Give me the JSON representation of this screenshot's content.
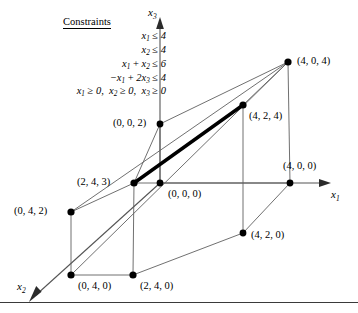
{
  "figure": {
    "type": "3d-polytope-diagram",
    "width": 358,
    "height": 313,
    "background": "#ffffff",
    "line_color": "#555555",
    "highlight_color": "#000000",
    "vertex_color": "#000000"
  },
  "constraints": {
    "title": "Constraints",
    "lines": [
      {
        "id": "c1",
        "text": "x1 ≤ 4",
        "html": "<i>x</i><sub>1</sub> <span class=\"op\">≤</span> 4"
      },
      {
        "id": "c2",
        "text": "x2 ≤ 4",
        "html": "<i>x</i><sub>2</sub> <span class=\"op\">≤</span> 4"
      },
      {
        "id": "c3",
        "text": "x1 + x2 ≤ 6",
        "html": "<i>x</i><sub>1</sub> <span class=\"op\">+</span> <i>x</i><sub>2</sub> <span class=\"op\">≤</span> 6"
      },
      {
        "id": "c4",
        "text": "−x1 + 2x3 ≤ 4",
        "html": "<span class=\"op\">−</span><i>x</i><sub>1</sub> <span class=\"op\">+</span> 2<i>x</i><sub>3</sub> <span class=\"op\">≤</span> 4"
      },
      {
        "id": "c5",
        "text": "x1 ≥ 0,  x2 ≥ 0,  x3 ≥ 0",
        "html": "<i>x</i><sub>1</sub> <span class=\"op\">≥</span> 0,&nbsp; <i>x</i><sub>2</sub> <span class=\"op\">≥</span> 0,&nbsp; <i>x</i><sub>3</sub> <span class=\"op\">≥</span> 0"
      }
    ]
  },
  "axes": [
    {
      "id": "x1",
      "label": "x1",
      "html": "<i>x</i><sub>1</sub>",
      "x": 330,
      "y": 190,
      "direction": "right"
    },
    {
      "id": "x2",
      "label": "x2",
      "html": "<i>x</i><sub>2</sub>",
      "x": 18,
      "y": 282,
      "direction": "down-left"
    },
    {
      "id": "x3",
      "label": "x3",
      "html": "<i>x</i><sub>3</sub>",
      "x": 150,
      "y": 8,
      "direction": "up"
    }
  ],
  "vertices": [
    {
      "id": "v000",
      "label": "(0, 0, 0)",
      "px": 160,
      "py": 183,
      "label_x": 168,
      "label_y": 189,
      "dot": true
    },
    {
      "id": "v002",
      "label": "(0, 0, 2)",
      "px": 160,
      "py": 124,
      "label_x": 113,
      "label_y": 118,
      "dot": true
    },
    {
      "id": "v400",
      "label": "(4, 0, 0)",
      "px": 290,
      "py": 183,
      "label_x": 283,
      "label_y": 161,
      "dot": true
    },
    {
      "id": "v404",
      "label": "(4, 0, 4)",
      "px": 288,
      "py": 62,
      "label_x": 297,
      "label_y": 56,
      "dot": true
    },
    {
      "id": "v424",
      "label": "(4, 2, 4)",
      "px": 243,
      "py": 105,
      "label_x": 249,
      "label_y": 111,
      "dot": true
    },
    {
      "id": "v420",
      "label": "(4, 2, 0)",
      "px": 243,
      "py": 233,
      "label_x": 251,
      "label_y": 239,
      "dot": true
    },
    {
      "id": "v243",
      "label": "(2, 4, 3)",
      "px": 134,
      "py": 183,
      "label_x": 77,
      "label_y": 177,
      "dot": true
    },
    {
      "id": "v240",
      "label": "(2, 4, 0)",
      "px": 133,
      "py": 275,
      "label_x": 140,
      "label_y": 281,
      "dot": true
    },
    {
      "id": "v042",
      "label": "(0, 4, 2)",
      "px": 71,
      "py": 212,
      "label_x": 14,
      "label_y": 206,
      "dot": true
    },
    {
      "id": "v040",
      "label": "(0, 4, 0)",
      "px": 71,
      "py": 275,
      "label_x": 78,
      "label_y": 281,
      "dot": true
    }
  ],
  "edges": [
    {
      "from": "v000",
      "to": "v400",
      "style": "thin"
    },
    {
      "from": "v000",
      "to": "v002",
      "style": "thin"
    },
    {
      "from": "v000",
      "to": "v243",
      "style": "thin"
    },
    {
      "from": "v002",
      "to": "v404",
      "style": "thin"
    },
    {
      "from": "v002",
      "to": "v243",
      "style": "thin"
    },
    {
      "from": "v400",
      "to": "v404",
      "style": "thin"
    },
    {
      "from": "v400",
      "to": "v420",
      "style": "thin"
    },
    {
      "from": "v404",
      "to": "v424",
      "style": "thin"
    },
    {
      "from": "v424",
      "to": "v420",
      "style": "thin"
    },
    {
      "from": "v243",
      "to": "v042",
      "style": "thin"
    },
    {
      "from": "v243",
      "to": "v240",
      "style": "thin"
    },
    {
      "from": "v042",
      "to": "v040",
      "style": "thin"
    },
    {
      "from": "v042",
      "to": "v404",
      "style": "thin"
    },
    {
      "from": "v040",
      "to": "v240",
      "style": "thin"
    },
    {
      "from": "v040",
      "to": "v042",
      "style": "thin"
    },
    {
      "from": "v240",
      "to": "v420",
      "style": "thin"
    },
    {
      "from": "v040",
      "to": "v404",
      "style": "thin"
    },
    {
      "from": "v243",
      "to": "v424",
      "style": "thick"
    }
  ],
  "highlight_edge": {
    "from": "(2, 4, 3)",
    "to": "(4, 2, 4)",
    "description": "optimal-edge"
  }
}
